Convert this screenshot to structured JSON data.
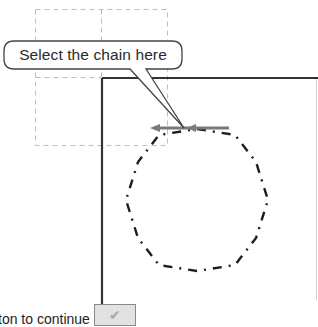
{
  "callout": {
    "text": "Select the chain here"
  },
  "instruction": {
    "text": "ton to continue"
  },
  "ok_button": {
    "icon": "checkmark-icon",
    "glyph": "✔"
  },
  "colors": {
    "frame": "#333333",
    "guide_dashed": "#b5b5b5",
    "arrow": "#7a7a7a",
    "chain": "#1e1e1e",
    "callout_border": "#444444"
  }
}
